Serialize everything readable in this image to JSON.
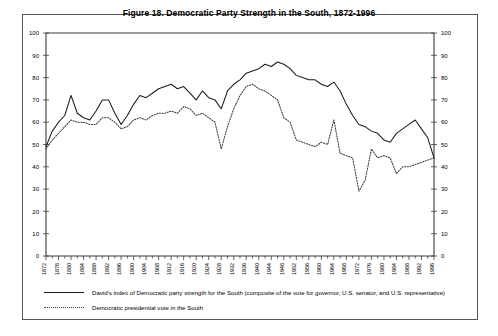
{
  "figure": {
    "title": "Figure 18.  Democratic Party Strength in the South, 1872-1996"
  },
  "legend": {
    "items": [
      {
        "style": "solid",
        "label": "David's index of Democratic party strength for the South (composite of the vote for governor, U.S. senator, and U.S. representative)"
      },
      {
        "style": "dotted",
        "label": "Democratic presidential vote in the South"
      }
    ]
  },
  "chart_data": {
    "type": "line",
    "title": "Figure 18.  Democratic Party Strength in the South, 1872-1996",
    "xlabel": "",
    "ylabel": "",
    "ylim": [
      0,
      100
    ],
    "ytick_step": 10,
    "yticks": [
      0,
      10,
      20,
      30,
      40,
      50,
      60,
      70,
      80,
      90,
      100
    ],
    "xlim": [
      1872,
      1996
    ],
    "xtick_step": 4,
    "minor_xtick_step": 2,
    "grid": false,
    "legend_position": "below-plot-left",
    "dual_y_axis": true,
    "x": [
      1872,
      1874,
      1876,
      1878,
      1880,
      1882,
      1884,
      1886,
      1888,
      1890,
      1892,
      1894,
      1896,
      1898,
      1900,
      1902,
      1904,
      1906,
      1908,
      1910,
      1912,
      1914,
      1916,
      1918,
      1920,
      1922,
      1924,
      1926,
      1928,
      1930,
      1932,
      1934,
      1936,
      1938,
      1940,
      1942,
      1944,
      1946,
      1948,
      1950,
      1952,
      1954,
      1956,
      1958,
      1960,
      1962,
      1964,
      1966,
      1968,
      1970,
      1972,
      1974,
      1976,
      1978,
      1980,
      1982,
      1984,
      1986,
      1988,
      1990,
      1992,
      1994,
      1996
    ],
    "xtick_labels": [
      "1872",
      "1876",
      "1880",
      "1884",
      "1888",
      "1892",
      "1896",
      "1900",
      "1904",
      "1908",
      "1912",
      "1916",
      "1920",
      "1924",
      "1928",
      "1932",
      "1936",
      "1940",
      "1944",
      "1948",
      "1952",
      "1956",
      "1960",
      "1964",
      "1968",
      "1972",
      "1976",
      "1980",
      "1984",
      "1988",
      "1992",
      "1996"
    ],
    "series": [
      {
        "name": "David's index of Democratic party strength for the South (composite of the vote for governor, U.S. senator, and U.S. representative)",
        "style": "solid",
        "values": [
          49,
          56,
          60,
          63,
          72,
          64,
          62,
          61,
          65,
          70,
          70,
          64,
          59,
          63,
          68,
          72,
          71,
          73,
          75,
          76,
          77,
          75,
          76,
          73,
          70,
          74,
          71,
          70,
          66,
          74,
          77,
          79,
          82,
          83,
          84,
          86,
          85,
          87,
          86,
          84,
          81,
          80,
          79,
          79,
          77,
          76,
          78,
          74,
          68,
          63,
          59,
          58,
          56,
          55,
          52,
          51,
          55,
          57,
          59,
          61,
          57,
          53,
          44
        ]
      },
      {
        "name": "Democratic presidential vote in the South",
        "style": "dotted",
        "values": [
          48,
          52,
          55,
          58,
          61,
          60,
          60,
          59,
          59,
          62,
          62,
          60,
          57,
          58,
          61,
          62,
          61,
          63,
          64,
          64,
          65,
          64,
          67,
          66,
          63,
          64,
          62,
          60,
          48,
          58,
          66,
          72,
          76,
          77,
          75,
          74,
          72,
          70,
          62,
          60,
          52,
          51,
          50,
          49,
          51,
          50,
          61,
          46,
          45,
          44,
          29,
          34,
          48,
          44,
          45,
          44,
          37,
          40,
          40,
          41,
          42,
          43,
          44
        ]
      }
    ],
    "annotations": []
  }
}
